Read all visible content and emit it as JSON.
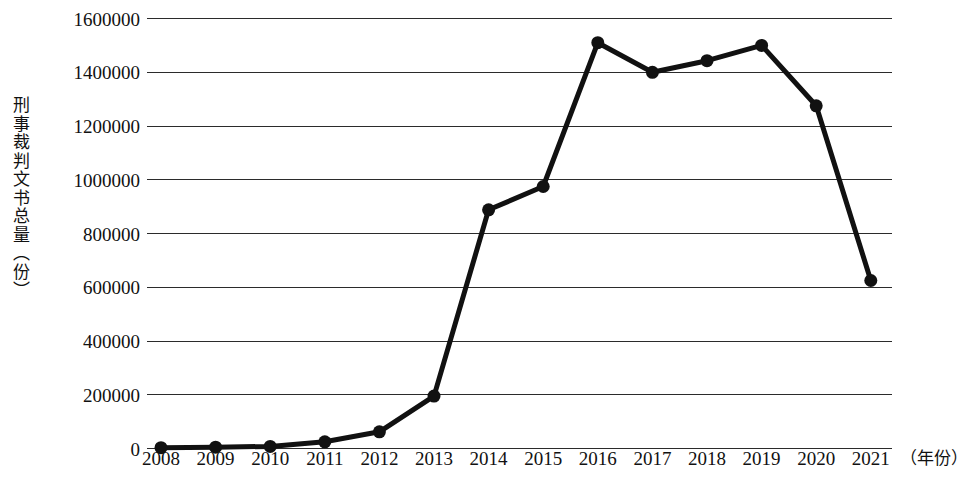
{
  "chart_data": {
    "type": "line",
    "title": "",
    "subtitle": "",
    "xlabel": "（年份）",
    "ylabel": "刑事裁判文书总量（份）",
    "categories": [
      "2008",
      "2009",
      "2010",
      "2011",
      "2012",
      "2013",
      "2014",
      "2015",
      "2016",
      "2017",
      "2018",
      "2019",
      "2020",
      "2021"
    ],
    "values": [
      3000,
      5000,
      8000,
      25000,
      62000,
      195000,
      888000,
      975000,
      1510000,
      1400000,
      1443000,
      1500000,
      1275000,
      625000
    ],
    "series": [
      {
        "name": "刑事裁判文书总量（份）",
        "values": [
          3000,
          5000,
          8000,
          25000,
          62000,
          195000,
          888000,
          975000,
          1510000,
          1400000,
          1443000,
          1500000,
          1275000,
          625000
        ]
      }
    ],
    "ylim": [
      0,
      1600000
    ],
    "ytick_values": [
      0,
      200000,
      400000,
      600000,
      800000,
      1000000,
      1200000,
      1400000,
      1600000
    ],
    "ytick_labels": [
      "0",
      "200000",
      "400000",
      "600000",
      "800000",
      "1000000",
      "1200000",
      "1400000",
      "1600000"
    ],
    "xtick_labels": [
      "2008",
      "2009",
      "2010",
      "2011",
      "2012",
      "2013",
      "2014",
      "2015",
      "2016",
      "2017",
      "2018",
      "2019",
      "2020",
      "2021"
    ],
    "grid": true,
    "grid_axis": "y",
    "legend": false,
    "legend_position": "none",
    "annotations": [],
    "line_color": "#111111",
    "marker": "circle",
    "marker_color": "#111111",
    "background_color": "#ffffff",
    "gridline_color": "#2b2b2b"
  }
}
